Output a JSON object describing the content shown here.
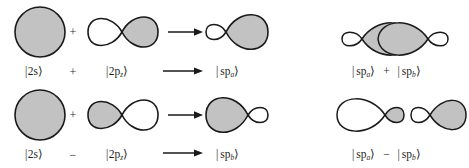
{
  "figure": {
    "background_color": "#ffffff",
    "lobe_fill_positive": "#c2c2c2",
    "lobe_fill_negative": "#ffffff",
    "outline_color": "#1a1a1a"
  },
  "rows": [
    {
      "id": "row-a",
      "shape_operator": "+",
      "label_operator": "+",
      "arrow": "→",
      "terms": {
        "s_orbital": {
          "bra": "|",
          "base": "2s",
          "sub": "",
          "ket": "⟩"
        },
        "p_orbital": {
          "bra": "|",
          "base": "2p",
          "sub": "z",
          "ket": "⟩"
        },
        "hybrid": {
          "bra": "|",
          "base": "sp",
          "sub": "a",
          "ket": "⟩"
        }
      },
      "combination": {
        "left": {
          "bra": "|",
          "base": "sp",
          "sub": "a",
          "ket": "⟩"
        },
        "operator": "+",
        "right": {
          "bra": "|",
          "base": "sp",
          "sub": "b",
          "ket": "⟩"
        }
      }
    },
    {
      "id": "row-b",
      "shape_operator": "+",
      "label_operator": "−",
      "arrow": "→",
      "terms": {
        "s_orbital": {
          "bra": "|",
          "base": "2s",
          "sub": "",
          "ket": "⟩"
        },
        "p_orbital": {
          "bra": "|",
          "base": "2p",
          "sub": "z",
          "ket": "⟩"
        },
        "hybrid": {
          "bra": "|",
          "base": "sp",
          "sub": "b",
          "ket": "⟩"
        }
      },
      "combination": {
        "left": {
          "bra": "|",
          "base": "sp",
          "sub": "a",
          "ket": "⟩"
        },
        "operator": "−",
        "right": {
          "bra": "|",
          "base": "sp",
          "sub": "b",
          "ket": "⟩"
        }
      }
    }
  ]
}
